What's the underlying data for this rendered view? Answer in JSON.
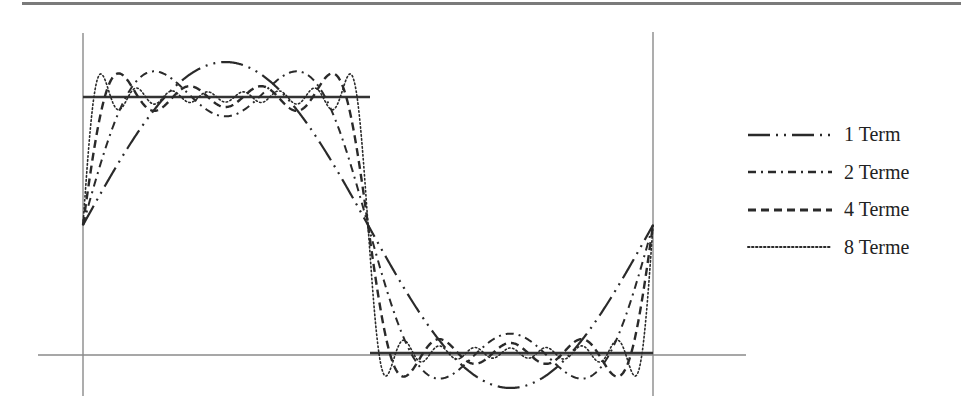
{
  "chart_data": {
    "type": "line",
    "title": "",
    "xlabel": "",
    "ylabel": "",
    "square_wave": {
      "high": 1,
      "low": -1,
      "period": 2,
      "x_range": [
        0,
        2
      ]
    },
    "series": [
      {
        "name": "1 Term",
        "terms": 1,
        "dash": "22 6 2 6 2 6",
        "width": 2.2,
        "values_note": "(4/π)·sin(πx)"
      },
      {
        "name": "2 Terme",
        "terms": 2,
        "dash": "8 5 2 5",
        "width": 2,
        "values_note": "(4/π)·[sin(πx)+sin(3πx)/3]"
      },
      {
        "name": "4 Terme",
        "terms": 4,
        "dash": "8 5",
        "width": 2.4,
        "values_note": "(4/π)·Σ_{k=1..4} sin((2k−1)πx)/(2k−1)"
      },
      {
        "name": "8 Terme",
        "terms": 8,
        "dash": "1.5 2.5",
        "width": 1.6,
        "values_note": "(4/π)·Σ_{k=1..8} sin((2k−1)πx)/(2k−1)"
      }
    ],
    "legend_position": "right",
    "grid": false
  },
  "geometry": {
    "x0": 83,
    "xmid": 368,
    "x1": 653,
    "ymid": 225,
    "amp": 128,
    "axis_y": 355,
    "axis_x_start": 38,
    "axis_x_end": 746,
    "vline_top_left": 33,
    "vline_top_right": 32,
    "vline_bottom": 396
  },
  "colors": {
    "curve": "#2a2a2a",
    "axis": "#8a8a8a",
    "square": "#333333",
    "rule": "#7a7a7a"
  },
  "legend": {
    "items": [
      {
        "label": "1 Term"
      },
      {
        "label": "2 Terme"
      },
      {
        "label": "4 Terme"
      },
      {
        "label": "8 Terme"
      }
    ]
  }
}
